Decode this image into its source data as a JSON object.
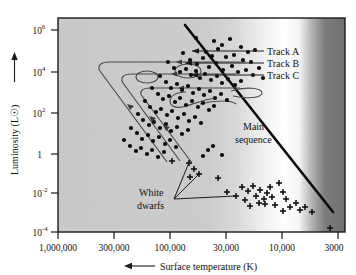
{
  "chart_data": {
    "type": "scatter",
    "title": "",
    "xlabel": "Surface temperature (K)",
    "ylabel": "Luminosity (L☉)",
    "xscale": "log-reversed",
    "yscale": "log",
    "grid": false,
    "legend_position": "inline-annotations",
    "x_ticks": [
      {
        "label": "1,000,000",
        "px": 58
      },
      {
        "label": "300,000",
        "px": 114
      },
      {
        "label": "100,000",
        "px": 170
      },
      {
        "label": "30,000",
        "px": 226
      },
      {
        "label": "10,000",
        "px": 282
      },
      {
        "label": "3000",
        "px": 338
      }
    ],
    "y_ticks": [
      {
        "base": "10",
        "exp": "6",
        "label": "10^6",
        "px": 30
      },
      {
        "base": "10",
        "exp": "4",
        "label": "10^4",
        "px": 72
      },
      {
        "base": "10",
        "exp": "2",
        "label": "10^2",
        "px": 113
      },
      {
        "base": "1",
        "exp": "",
        "label": "1",
        "px": 154
      },
      {
        "base": "10",
        "exp": "-2",
        "label": "10^-2",
        "px": 193
      },
      {
        "base": "10",
        "exp": "-4",
        "label": "10^-4",
        "px": 232
      }
    ],
    "xlim_px": [
      58,
      345
    ],
    "ylim_px": [
      18,
      232
    ],
    "annotations": [
      {
        "name": "track-a",
        "text": "Track A"
      },
      {
        "name": "track-b",
        "text": "Track B"
      },
      {
        "name": "track-c",
        "text": "Track C"
      },
      {
        "name": "main-sequence",
        "text": "Main",
        "text2": "sequence"
      },
      {
        "name": "white-dwarfs",
        "text": "White",
        "text2": "dwarfs"
      }
    ],
    "series": [
      {
        "name": "stars",
        "marker": "dot",
        "points_px": [
          [
            196,
            38
          ],
          [
            214,
            41
          ],
          [
            222,
            45
          ],
          [
            230,
            39
          ],
          [
            241,
            47
          ],
          [
            248,
            52
          ],
          [
            255,
            50
          ],
          [
            206,
            52
          ],
          [
            212,
            56
          ],
          [
            218,
            49
          ],
          [
            226,
            57
          ],
          [
            234,
            55
          ],
          [
            243,
            60
          ],
          [
            251,
            62
          ],
          [
            183,
            53
          ],
          [
            190,
            60
          ],
          [
            197,
            64
          ],
          [
            203,
            58
          ],
          [
            209,
            67
          ],
          [
            216,
            63
          ],
          [
            223,
            70
          ],
          [
            232,
            66
          ],
          [
            238,
            72
          ],
          [
            246,
            70
          ],
          [
            253,
            75
          ],
          [
            259,
            68
          ],
          [
            263,
            78
          ],
          [
            168,
            62
          ],
          [
            174,
            68
          ],
          [
            180,
            72
          ],
          [
            186,
            69
          ],
          [
            191,
            75
          ],
          [
            196,
            71
          ],
          [
            200,
            78
          ],
          [
            205,
            74
          ],
          [
            211,
            80
          ],
          [
            217,
            76
          ],
          [
            222,
            83
          ],
          [
            228,
            79
          ],
          [
            235,
            85
          ],
          [
            241,
            81
          ],
          [
            160,
            76
          ],
          [
            166,
            82
          ],
          [
            171,
            88
          ],
          [
            177,
            84
          ],
          [
            182,
            90
          ],
          [
            188,
            86
          ],
          [
            193,
            93
          ],
          [
            199,
            89
          ],
          [
            204,
            95
          ],
          [
            210,
            91
          ],
          [
            215,
            98
          ],
          [
            221,
            94
          ],
          [
            227,
            100
          ],
          [
            152,
            88
          ],
          [
            158,
            94
          ],
          [
            163,
            99
          ],
          [
            169,
            96
          ],
          [
            175,
            102
          ],
          [
            180,
            98
          ],
          [
            186,
            105
          ],
          [
            192,
            101
          ],
          [
            198,
            107
          ],
          [
            203,
            103
          ],
          [
            209,
            110
          ],
          [
            214,
            106
          ],
          [
            145,
            101
          ],
          [
            150,
            107
          ],
          [
            156,
            112
          ],
          [
            161,
            109
          ],
          [
            167,
            115
          ],
          [
            172,
            111
          ],
          [
            178,
            118
          ],
          [
            184,
            114
          ],
          [
            189,
            121
          ],
          [
            195,
            117
          ],
          [
            201,
            123
          ],
          [
            138,
            114
          ],
          [
            143,
            120
          ],
          [
            149,
            125
          ],
          [
            154,
            122
          ],
          [
            160,
            128
          ],
          [
            166,
            124
          ],
          [
            171,
            131
          ],
          [
            177,
            127
          ],
          [
            182,
            134
          ],
          [
            188,
            130
          ],
          [
            131,
            128
          ],
          [
            137,
            133
          ],
          [
            142,
            139
          ],
          [
            148,
            135
          ],
          [
            153,
            141
          ],
          [
            159,
            137
          ],
          [
            165,
            144
          ],
          [
            170,
            140
          ],
          [
            176,
            147
          ],
          [
            124,
            140
          ],
          [
            130,
            146
          ],
          [
            136,
            151
          ],
          [
            141,
            148
          ],
          [
            147,
            154
          ],
          [
            152,
            150
          ],
          [
            158,
            157
          ],
          [
            164,
            152
          ],
          [
            208,
            150
          ],
          [
            213,
            146
          ],
          [
            203,
            156
          ],
          [
            222,
            155
          ]
        ]
      },
      {
        "name": "white-dwarfs",
        "marker": "plus",
        "points_px": [
          [
            172,
            161
          ],
          [
            189,
            163
          ],
          [
            194,
            169
          ],
          [
            199,
            174
          ],
          [
            190,
            177
          ],
          [
            218,
            178
          ],
          [
            242,
            187
          ],
          [
            248,
            191
          ],
          [
            253,
            186
          ],
          [
            256,
            196
          ],
          [
            260,
            190
          ],
          [
            264,
            199
          ],
          [
            267,
            193
          ],
          [
            270,
            187
          ],
          [
            272,
            197
          ],
          [
            259,
            203
          ],
          [
            265,
            204
          ],
          [
            275,
            205
          ],
          [
            279,
            183
          ],
          [
            283,
            192
          ],
          [
            286,
            199
          ],
          [
            290,
            207
          ],
          [
            296,
            203
          ],
          [
            300,
            210
          ],
          [
            305,
            207
          ],
          [
            312,
            212
          ],
          [
            330,
            228
          ],
          [
            236,
            196
          ],
          [
            245,
            200
          ],
          [
            250,
            206
          ],
          [
            227,
            192
          ],
          [
            283,
            211
          ]
        ]
      }
    ],
    "main_sequence_line": {
      "name": "main-sequence-band",
      "from_px": [
        185,
        25
      ],
      "to_px": [
        333,
        212
      ]
    },
    "tracks": [
      {
        "name": "Track A",
        "label_x": 268,
        "label_y": 54,
        "leader_from_px": [
          265,
          51
        ],
        "leader_to_px": [
          193,
          51
        ]
      },
      {
        "name": "Track B",
        "label_x": 268,
        "label_y": 66,
        "leader_from_px": [
          265,
          63
        ],
        "leader_to_px": [
          190,
          63
        ]
      },
      {
        "name": "Track C",
        "label_x": 268,
        "label_y": 78,
        "leader_from_px": [
          265,
          75
        ],
        "leader_to_px": [
          193,
          75
        ]
      }
    ],
    "background_gradient": {
      "stops": [
        {
          "pos": 0.0,
          "color": "#c9c9c9"
        },
        {
          "pos": 0.52,
          "color": "#cccccc"
        },
        {
          "pos": 0.62,
          "color": "#d8d8d8"
        },
        {
          "pos": 0.72,
          "color": "#f2f2f2"
        },
        {
          "pos": 0.79,
          "color": "#ffffff"
        },
        {
          "pos": 0.84,
          "color": "#f6f6f6"
        },
        {
          "pos": 0.88,
          "color": "#b9b9b9"
        },
        {
          "pos": 0.93,
          "color": "#7c7c7c"
        },
        {
          "pos": 1.0,
          "color": "#6e6e6e"
        }
      ]
    }
  },
  "colors": {
    "axis": "#1a1a1a",
    "plot_border": "#1a1a1a",
    "star_dot": "#0a0a0a",
    "track_line": "#3a3a3a",
    "main_sequence": "#0a0a0a",
    "text": "#111111"
  }
}
